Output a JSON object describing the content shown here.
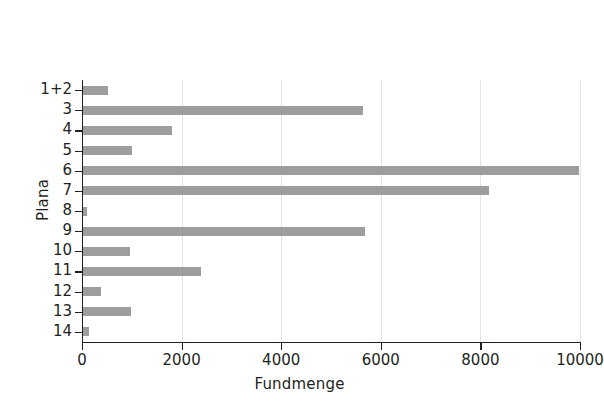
{
  "chart_data": {
    "type": "bar",
    "orientation": "horizontal",
    "title": "",
    "xlabel": "Fundmenge",
    "ylabel": "Plana",
    "categories": [
      "1+2",
      "3",
      "4",
      "5",
      "6",
      "7",
      "8",
      "9",
      "10",
      "11",
      "12",
      "13",
      "14"
    ],
    "values": [
      520,
      5650,
      1800,
      1000,
      9980,
      8180,
      100,
      5680,
      960,
      2380,
      380,
      990,
      150
    ],
    "xlim": [
      0,
      10000
    ],
    "xticks": [
      0,
      2000,
      4000,
      6000,
      8000,
      10000
    ],
    "xtick_labels": [
      "0",
      "2000",
      "4000",
      "6000",
      "8000",
      "10000"
    ],
    "grid": "vertical-light",
    "legend": null,
    "bar_color": "#9d9d9d",
    "axis_color": "#231f20"
  }
}
